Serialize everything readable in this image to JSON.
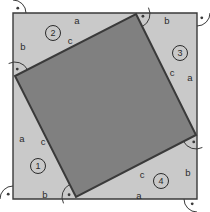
{
  "figure": {
    "type": "geometry-diagram",
    "canvas": {
      "width": 210,
      "height": 212
    },
    "colors": {
      "background": "#ffffff",
      "outer_square_fill": "#c9c9c9",
      "inner_square_fill": "#808080",
      "stroke": "#3a3a3a",
      "text": "#2b2b2b"
    },
    "outer_square": {
      "name": "outer-square",
      "points": "13,13 197,13 197,199 13,199",
      "stroke_width": 1.4
    },
    "inner_square": {
      "name": "inner-square",
      "points": "136,14 196,135 76,197 15,76",
      "stroke_width": 2.0
    },
    "right_angle_markers": [
      {
        "name": "right-angle-outer-top-left",
        "cx": 13,
        "cy": 13,
        "start_deg": 0,
        "end_deg": 90,
        "r": 13,
        "dot_deg": 45
      },
      {
        "name": "right-angle-outer-top-right",
        "cx": 197,
        "cy": 13,
        "start_deg": 90,
        "end_deg": 180,
        "r": 13,
        "dot_deg": 135
      },
      {
        "name": "right-angle-outer-bottom-right",
        "cx": 197,
        "cy": 199,
        "start_deg": 180,
        "end_deg": 270,
        "r": 13,
        "dot_deg": 225
      },
      {
        "name": "right-angle-outer-bottom-left",
        "cx": 13,
        "cy": 199,
        "start_deg": 270,
        "end_deg": 360,
        "r": 13,
        "dot_deg": 315
      },
      {
        "name": "right-angle-inner-top",
        "cx": 136,
        "cy": 14,
        "start_deg": 63,
        "end_deg": 153,
        "r": 14,
        "dot_deg": 108
      },
      {
        "name": "right-angle-inner-right",
        "cx": 196,
        "cy": 135,
        "start_deg": 153,
        "end_deg": 243,
        "r": 14,
        "dot_deg": 198
      },
      {
        "name": "right-angle-inner-bottom",
        "cx": 76,
        "cy": 197,
        "start_deg": 243,
        "end_deg": 333,
        "r": 14,
        "dot_deg": 288
      },
      {
        "name": "right-angle-inner-left",
        "cx": 15,
        "cy": 76,
        "start_deg": 333,
        "end_deg": 423,
        "r": 14,
        "dot_deg": 18
      }
    ],
    "side_labels": [
      {
        "name": "label-a-top",
        "text": "a",
        "x": 77,
        "y": 21
      },
      {
        "name": "label-c-top-left",
        "text": "c",
        "x": 70,
        "y": 41
      },
      {
        "name": "label-b-left-upper",
        "text": "b",
        "x": 23,
        "y": 47
      },
      {
        "name": "label-b-top-right",
        "text": "b",
        "x": 167,
        "y": 21
      },
      {
        "name": "label-c-right",
        "text": "c",
        "x": 172,
        "y": 73
      },
      {
        "name": "label-a-right",
        "text": "a",
        "x": 190,
        "y": 78
      },
      {
        "name": "label-a-left-lower",
        "text": "a",
        "x": 22,
        "y": 139
      },
      {
        "name": "label-c-left",
        "text": "c",
        "x": 43,
        "y": 142
      },
      {
        "name": "label-b-bottom-left",
        "text": "b",
        "x": 45,
        "y": 195
      },
      {
        "name": "label-c-bottom",
        "text": "c",
        "x": 142,
        "y": 175
      },
      {
        "name": "label-b-bottom-right",
        "text": "b",
        "x": 188,
        "y": 173
      },
      {
        "name": "label-a-bottom",
        "text": "a",
        "x": 139,
        "y": 196
      }
    ],
    "region_markers": [
      {
        "name": "region-marker-1",
        "text": "1",
        "x": 38,
        "y": 166,
        "r": 7.5
      },
      {
        "name": "region-marker-2",
        "text": "2",
        "x": 53,
        "y": 33,
        "r": 7.5
      },
      {
        "name": "region-marker-3",
        "text": "3",
        "x": 180,
        "y": 53,
        "r": 7.5
      },
      {
        "name": "region-marker-4",
        "text": "4",
        "x": 161,
        "y": 181,
        "r": 7.5
      }
    ]
  }
}
